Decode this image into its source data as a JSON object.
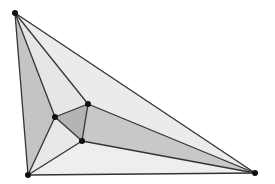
{
  "diagram": {
    "type": "triangulation",
    "vertices": {
      "top": [
        15,
        13
      ],
      "bottom_left": [
        28,
        175
      ],
      "bottom_right": [
        255,
        173
      ],
      "inner_a": [
        55,
        117
      ],
      "inner_b": [
        88,
        104
      ],
      "inner_c": [
        82,
        141
      ]
    },
    "faces": [
      {
        "name": "face-top-a-bl",
        "points": "15,13 55,117 28,175",
        "fill": "#c4c4c4"
      },
      {
        "name": "face-top-a-b",
        "points": "15,13 55,117 88,104",
        "fill": "#e6e6e6"
      },
      {
        "name": "face-top-b-br",
        "points": "15,13 88,104 255,173",
        "fill": "#ebebeb"
      },
      {
        "name": "face-a-b-c",
        "points": "55,117 88,104 82,141",
        "fill": "#b4b4b4"
      },
      {
        "name": "face-b-c-br",
        "points": "88,104 82,141 255,173",
        "fill": "#c8c8c8"
      },
      {
        "name": "face-a-c-bl",
        "points": "55,117 82,141 28,175",
        "fill": "#e8e8e8"
      },
      {
        "name": "face-c-br-bl",
        "points": "82,141 255,173 28,175",
        "fill": "#eeeeee"
      }
    ],
    "edges": [
      [
        15,
        13,
        28,
        175
      ],
      [
        15,
        13,
        255,
        173
      ],
      [
        28,
        175,
        255,
        173
      ],
      [
        15,
        13,
        55,
        117
      ],
      [
        15,
        13,
        88,
        104
      ],
      [
        28,
        175,
        55,
        117
      ],
      [
        28,
        175,
        82,
        141
      ],
      [
        255,
        173,
        88,
        104
      ],
      [
        255,
        173,
        82,
        141
      ],
      [
        55,
        117,
        88,
        104
      ],
      [
        88,
        104,
        82,
        141
      ],
      [
        82,
        141,
        55,
        117
      ]
    ],
    "colors": {
      "edge": "#333333",
      "vertex": "#111111"
    }
  }
}
